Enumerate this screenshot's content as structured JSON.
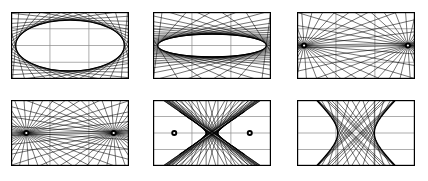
{
  "figure": {
    "title": "",
    "caption": "",
    "background_color": "#ffffff",
    "stroke_color": "#000000",
    "grid_color": "#8a8a8a",
    "border_color": "#000000",
    "width": 428,
    "height": 181,
    "columns": 3,
    "rows": 2
  },
  "chart_data": {
    "type": "line",
    "xlabel": "",
    "ylabel": "",
    "grid": true,
    "legend": null,
    "panel_count": 6,
    "panels": [
      {
        "index": 1,
        "label": "",
        "position": {
          "x": 11,
          "y": 12,
          "w": 118,
          "h": 67
        },
        "conic": "ellipse",
        "eccentricity": 0.55,
        "semi_major_a": 0.46,
        "semi_minor_b": 0.38,
        "foci": [
          {
            "x": -0.26,
            "y": 0.0
          },
          {
            "x": 0.26,
            "y": 0.0
          }
        ],
        "foci_marked": false,
        "envelope_visible": true,
        "n_tangent_lines": 36,
        "grid_vertical_fractions": [
          0.33,
          0.66
        ],
        "grid_horizontal_fractions": [
          0.25,
          0.5,
          0.75
        ]
      },
      {
        "index": 2,
        "label": "",
        "position": {
          "x": 153,
          "y": 12,
          "w": 118,
          "h": 67
        },
        "conic": "ellipse",
        "eccentricity": 0.93,
        "semi_major_a": 0.46,
        "semi_minor_b": 0.17,
        "foci": [
          {
            "x": -0.425,
            "y": 0.0
          },
          {
            "x": 0.425,
            "y": 0.0
          }
        ],
        "foci_marked": false,
        "envelope_visible": true,
        "n_tangent_lines": 40,
        "grid_vertical_fractions": [
          0.33,
          0.66
        ],
        "grid_horizontal_fractions": [
          0.25,
          0.5,
          0.75
        ]
      },
      {
        "index": 3,
        "label": "",
        "position": {
          "x": 297,
          "y": 12,
          "w": 118,
          "h": 67
        },
        "conic": "degenerate-segment",
        "eccentricity": 1.0,
        "semi_major_a": 0.44,
        "semi_minor_b": 0.0,
        "foci": [
          {
            "x": -0.44,
            "y": 0.0
          },
          {
            "x": 0.44,
            "y": 0.0
          }
        ],
        "foci_marked": true,
        "envelope_visible": false,
        "n_tangent_lines": 36,
        "grid_vertical_fractions": [
          0.33,
          0.66
        ],
        "grid_horizontal_fractions": [
          0.25,
          0.5,
          0.75
        ]
      },
      {
        "index": 4,
        "label": "",
        "position": {
          "x": 11,
          "y": 100,
          "w": 118,
          "h": 66
        },
        "conic": "degenerate-segment",
        "eccentricity": 1.0,
        "semi_major_a": 0.37,
        "semi_minor_b": 0.0,
        "foci": [
          {
            "x": -0.37,
            "y": 0.0
          },
          {
            "x": 0.37,
            "y": 0.0
          }
        ],
        "foci_marked": true,
        "envelope_visible": false,
        "n_tangent_lines": 40,
        "grid_vertical_fractions": [
          0.33,
          0.66
        ],
        "grid_horizontal_fractions": [
          0.25,
          0.5,
          0.75
        ]
      },
      {
        "index": 5,
        "label": "",
        "position": {
          "x": 153,
          "y": 100,
          "w": 118,
          "h": 66
        },
        "conic": "hyperbola-nascent",
        "eccentricity": 1.12,
        "semi_major_a": 0.05,
        "semi_minor_b": 0.06,
        "foci": [
          {
            "x": -0.32,
            "y": 0.0
          },
          {
            "x": 0.32,
            "y": 0.0
          }
        ],
        "foci_marked": true,
        "envelope_visible": true,
        "n_tangent_lines": 46,
        "grid_vertical_fractions": [
          0.33,
          0.66
        ],
        "grid_horizontal_fractions": [
          0.25,
          0.5,
          0.75
        ]
      },
      {
        "index": 6,
        "label": "",
        "position": {
          "x": 297,
          "y": 100,
          "w": 118,
          "h": 66
        },
        "conic": "hyperbola",
        "eccentricity": 1.9,
        "semi_major_a": 0.155,
        "semi_minor_b": 0.26,
        "foci": [
          {
            "x": -0.3,
            "y": 0.0
          },
          {
            "x": 0.3,
            "y": 0.0
          }
        ],
        "foci_marked": false,
        "envelope_visible": true,
        "n_tangent_lines": 30,
        "grid_vertical_fractions": [
          0.33,
          0.66
        ],
        "grid_horizontal_fractions": [
          0.25,
          0.5,
          0.75
        ]
      }
    ]
  }
}
